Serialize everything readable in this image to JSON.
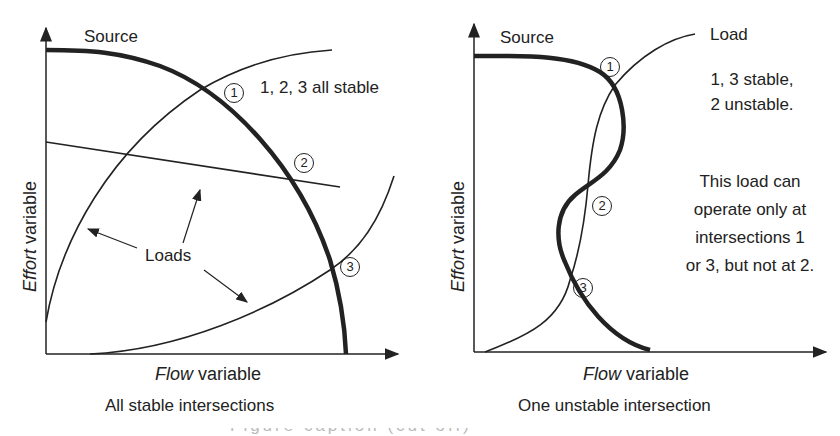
{
  "left_panel": {
    "source_label": "Source",
    "note": "1, 2, 3 all stable",
    "loads_label": "Loads",
    "y_label_italic": "Effort",
    "y_label_rest": "variable",
    "x_label_italic": "Flow",
    "x_label_rest": "variable",
    "caption": "All stable intersections",
    "markers": [
      "1",
      "2",
      "3"
    ]
  },
  "right_panel": {
    "source_label": "Source",
    "load_label": "Load",
    "note_line1": "1, 3 stable,",
    "note_line2": "2 unstable.",
    "desc_line1": "This load can",
    "desc_line2": "operate only at",
    "desc_line3": "intersections 1",
    "desc_line4": "or 3, but not at 2.",
    "y_label_italic": "Effort",
    "y_label_rest": "variable",
    "x_label_italic": "Flow",
    "x_label_rest": "variable",
    "caption": "One unstable intersection",
    "markers": [
      "1",
      "2",
      "3"
    ]
  },
  "footer": {
    "cut_caption": "Figure caption (cut off)"
  },
  "colors": {
    "ink": "#222222",
    "background": "#ffffff"
  }
}
